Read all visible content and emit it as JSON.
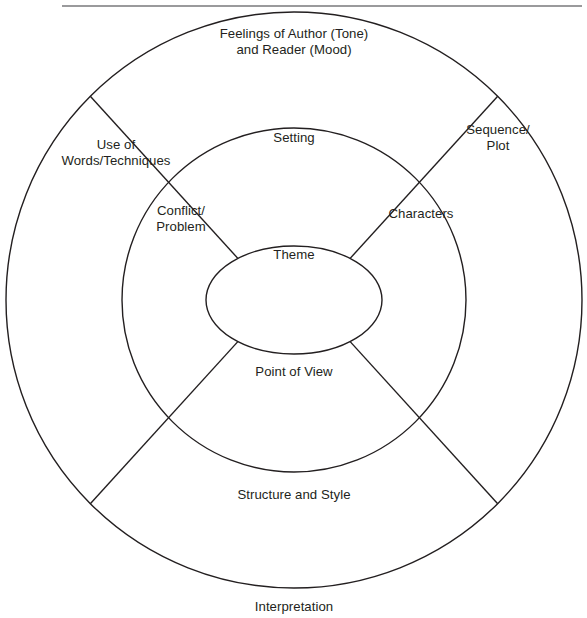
{
  "page": {
    "background_color": "#ffffff",
    "stroke_color": "#231f20",
    "text_color": "#231f20"
  },
  "header": {
    "crumb_text": "",
    "rule_color": "#9a9a9c"
  },
  "diagram": {
    "type": "concentric-circle",
    "ring_count": 3,
    "spoke_count": 4,
    "center": {
      "x": 294,
      "y": 300
    },
    "rings": [
      {
        "name": "outer-ring",
        "radius": 288
      },
      {
        "name": "middle-ring",
        "radius": 172
      },
      {
        "name": "inner-core",
        "rx": 88,
        "ry": 54
      }
    ],
    "spokes_degrees": [
      45,
      135,
      225,
      315
    ],
    "labels": {
      "tone_mood": "Feelings of Author (Tone)\nand Reader (Mood)",
      "use_of_words": "Use of\nWords/Techniques",
      "sequence_plot": "Sequence/\nPlot",
      "setting": "Setting",
      "conflict_problem": "Conflict/\nProblem",
      "characters": "Characters",
      "theme": "Theme",
      "point_of_view": "Point of View",
      "structure_and_style": "Structure and Style",
      "interpretation": "Interpretation"
    }
  }
}
